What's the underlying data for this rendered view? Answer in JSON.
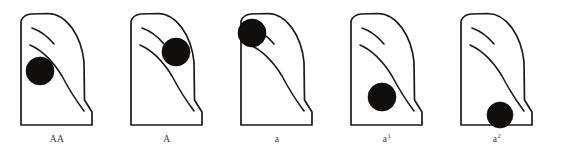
{
  "figure": {
    "background_color": "#ffffff",
    "outline_color": "#1a1a1a",
    "spot_color": "#100f0d",
    "panel_count": 5
  },
  "panels": [
    {
      "id": "panel-AA",
      "label": "AA",
      "label_base": "AA",
      "label_sup": "",
      "spot_position": "lower-left-margin",
      "spot_cx": 40,
      "spot_cy": 71,
      "spot_r": 14,
      "offset_x": 0
    },
    {
      "id": "panel-A",
      "label": "A",
      "label_base": "A",
      "label_sup": "",
      "spot_position": "mid-right-of-center",
      "spot_cx": 66,
      "spot_cy": 52,
      "spot_r": 14,
      "offset_x": 110
    },
    {
      "id": "panel-a",
      "label": "a",
      "label_base": "a",
      "label_sup": "",
      "spot_position": "upper-left-apex",
      "spot_cx": 32,
      "spot_cy": 33,
      "spot_r": 14,
      "offset_x": 220
    },
    {
      "id": "panel-a1",
      "label": "a1",
      "label_base": "a",
      "label_sup": "1",
      "spot_position": "lower-center",
      "spot_cx": 52,
      "spot_cy": 97,
      "spot_r": 14,
      "offset_x": 330
    },
    {
      "id": "panel-a2",
      "label": "a2",
      "label_base": "a",
      "label_sup": "2",
      "spot_position": "bottom-edge-right",
      "spot_cx": 60,
      "spot_cy": 115,
      "spot_r": 13,
      "offset_x": 440
    }
  ],
  "geometry": {
    "shell_path": "M 21 21 Q 23 15 31 14 L 48 13.5 Q 62 14 72 28 Q 82 42 84 62 L 84.5 100 L 92 112 L 92 125 L 21 125 Z",
    "ridge_upper": "M 32 28 Q 44 32 54 44",
    "ridge_lower": "M 30 45 Q 48 53 62 76 Q 72 95 84 111",
    "caption_y": 141
  }
}
